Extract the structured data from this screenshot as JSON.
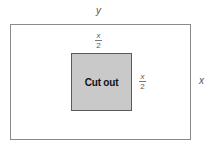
{
  "diagram": {
    "outer_rect": {
      "width_label": "y",
      "height_label": "x"
    },
    "inner_rect": {
      "label": "Cut out",
      "fill_color": "#c9c9c9",
      "top_label": {
        "numerator": "x",
        "denominator": "2"
      },
      "side_label": {
        "numerator": "x",
        "denominator": "2"
      }
    }
  }
}
